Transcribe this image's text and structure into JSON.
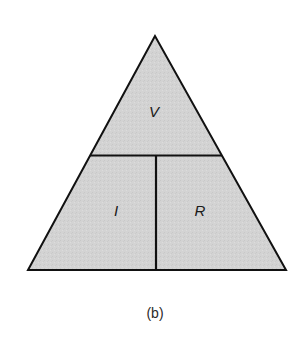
{
  "figure": {
    "caption": "(b)",
    "fill_color": "#d3d3d3",
    "line_color": "#111111",
    "sections": {
      "top": "V",
      "bottom_left": "I",
      "bottom_right": "R"
    }
  }
}
